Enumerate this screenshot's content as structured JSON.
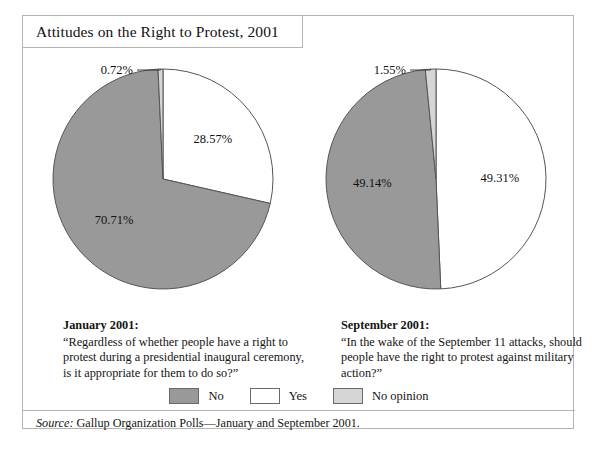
{
  "title": "Attitudes on the Right to Protest, 2001",
  "legend": [
    {
      "label": "No",
      "color": "#999999"
    },
    {
      "label": "Yes",
      "color": "#ffffff"
    },
    {
      "label": "No opinion",
      "color": "#d6d6d6"
    }
  ],
  "captions": {
    "left": {
      "heading": "January 2001:",
      "body": "“Regardless of whether people have a right to protest during a presidential inaugural ceremony, is it appropriate for them to do so?”"
    },
    "right": {
      "heading": "September 2001:",
      "body": "“In the wake of the September 11 attacks, should people have the right to protest against military action?”"
    }
  },
  "source": {
    "label": "Source:",
    "text": " Gallup Organization Polls—January and September 2001."
  },
  "chart_data": [
    {
      "type": "pie",
      "title": "January 2001",
      "labels": [
        "Yes",
        "No",
        "No opinion"
      ],
      "values": [
        28.57,
        70.71,
        0.72
      ],
      "value_labels": [
        "28.57%",
        "70.71%",
        "0.72%"
      ],
      "colors": [
        "#ffffff",
        "#999999",
        "#d6d6d6"
      ],
      "start_angle_deg": 0,
      "direction": "clockwise",
      "callout_slice": "No opinion",
      "legend_position": "bottom-center"
    },
    {
      "type": "pie",
      "title": "September 2001",
      "labels": [
        "Yes",
        "No",
        "No opinion"
      ],
      "values": [
        49.31,
        49.14,
        1.55
      ],
      "value_labels": [
        "49.31%",
        "49.14%",
        "1.55%"
      ],
      "colors": [
        "#ffffff",
        "#999999",
        "#d6d6d6"
      ],
      "start_angle_deg": 0,
      "direction": "clockwise",
      "callout_slice": "No opinion",
      "legend_position": "bottom-center"
    }
  ]
}
